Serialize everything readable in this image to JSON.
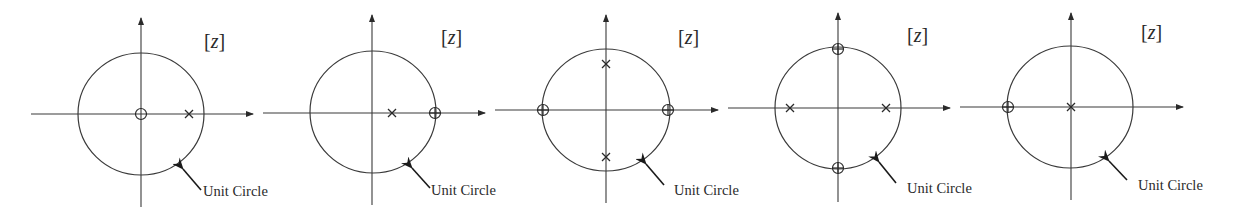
{
  "figure": {
    "type": "pole-zero plots",
    "plot_count": 5,
    "colors": {
      "ink": "#2a2a2a",
      "background": "#ffffff"
    },
    "plots": [
      {
        "label": "[z]",
        "annotation": "Unit Circle",
        "zeros": [
          {
            "re": 0,
            "im": 0
          }
        ],
        "poles": [
          {
            "re": 0.75,
            "im": 0
          }
        ]
      },
      {
        "label": "[z]",
        "annotation": "Unit Circle",
        "zeros": [
          {
            "re": 1,
            "im": 0
          }
        ],
        "poles": [
          {
            "re": 0.3,
            "im": 0
          }
        ]
      },
      {
        "label": "[z]",
        "annotation": "Unit Circle",
        "zeros": [
          {
            "re": 1,
            "im": 0
          },
          {
            "re": -1,
            "im": 0
          }
        ],
        "poles": [
          {
            "re": 0,
            "im": 0.75
          },
          {
            "re": 0,
            "im": -0.75
          }
        ]
      },
      {
        "label": "[z]",
        "annotation": "Unit Circle",
        "zeros": [
          {
            "re": 0,
            "im": 1
          },
          {
            "re": 0,
            "im": -1
          }
        ],
        "poles": [
          {
            "re": -0.75,
            "im": 0
          },
          {
            "re": 0.75,
            "im": 0
          }
        ]
      },
      {
        "label": "[z]",
        "annotation": "Unit Circle",
        "zeros": [
          {
            "re": -1,
            "im": 0
          }
        ],
        "poles": [
          {
            "re": 0,
            "im": 0
          }
        ]
      }
    ]
  }
}
